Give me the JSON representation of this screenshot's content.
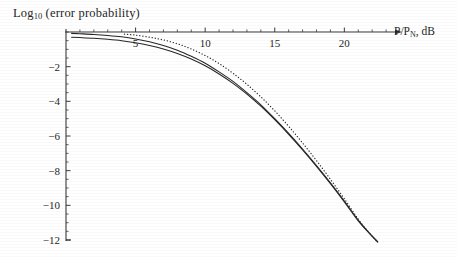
{
  "chart_data": {
    "type": "line",
    "title": "Log10 (error probability)",
    "title_base": "Log",
    "title_sub": "10",
    "title_rest": " (error probability)",
    "xlabel": "P/PN, dB",
    "xlabel_base": "P/P",
    "xlabel_sub": "N",
    "xlabel_rest": ", dB",
    "ylabel": "",
    "xlim": [
      0,
      24
    ],
    "ylim": [
      -12.6,
      0.4
    ],
    "grid": false,
    "legend": null,
    "xticks": [
      5,
      10,
      15,
      20
    ],
    "xtick_labels": [
      "5",
      "10",
      "15",
      "20"
    ],
    "x_minor_step": 1,
    "yticks": [
      -2,
      -4,
      -6,
      -8,
      -10,
      -12
    ],
    "ytick_labels": [
      "-2",
      "-4",
      "-6",
      "-8",
      "-10",
      "-12"
    ],
    "y_minor_step": 0.5,
    "axis_arrow_x": true,
    "series": [
      {
        "name": "curve-solid-upper",
        "style": "solid",
        "color": "#262626",
        "x": [
          0.4,
          1,
          2,
          3,
          4,
          5,
          6,
          7,
          8,
          9,
          10,
          11,
          12,
          13,
          14,
          15,
          16,
          17,
          18,
          19,
          20,
          21,
          21.8,
          22.4
        ],
        "y": [
          -0.08,
          -0.1,
          -0.14,
          -0.2,
          -0.28,
          -0.4,
          -0.56,
          -0.78,
          -1.05,
          -1.4,
          -1.8,
          -2.3,
          -2.85,
          -3.5,
          -4.2,
          -5.0,
          -5.85,
          -6.75,
          -7.7,
          -8.7,
          -9.75,
          -10.85,
          -11.6,
          -12.1
        ]
      },
      {
        "name": "curve-solid-lower",
        "style": "solid",
        "color": "#262626",
        "x": [
          0.4,
          1,
          2,
          3,
          4,
          5,
          6,
          7,
          8,
          9,
          10,
          11,
          12,
          13,
          14,
          15,
          16,
          17,
          18,
          19,
          20,
          21,
          21.8,
          22.4
        ],
        "y": [
          -0.3,
          -0.32,
          -0.36,
          -0.42,
          -0.5,
          -0.62,
          -0.78,
          -0.98,
          -1.24,
          -1.56,
          -1.95,
          -2.42,
          -2.96,
          -3.58,
          -4.28,
          -5.06,
          -5.9,
          -6.8,
          -7.75,
          -8.75,
          -9.8,
          -10.9,
          -11.62,
          -12.12
        ]
      },
      {
        "name": "curve-dotted",
        "style": "dotted",
        "color": "#2b2b2b",
        "x": [
          4.2,
          5,
          6,
          7,
          8,
          9,
          10,
          11,
          12,
          13,
          14,
          15,
          16,
          17,
          18,
          19,
          20,
          21,
          21.8,
          22.3
        ],
        "y": [
          -0.12,
          -0.18,
          -0.3,
          -0.46,
          -0.68,
          -0.98,
          -1.36,
          -1.82,
          -2.38,
          -3.02,
          -3.74,
          -4.55,
          -5.44,
          -6.4,
          -7.42,
          -8.5,
          -9.62,
          -10.8,
          -11.6,
          -12.05
        ]
      }
    ]
  },
  "figure": {
    "axis_color": "#3a3a3a",
    "background": "#ffffff"
  }
}
